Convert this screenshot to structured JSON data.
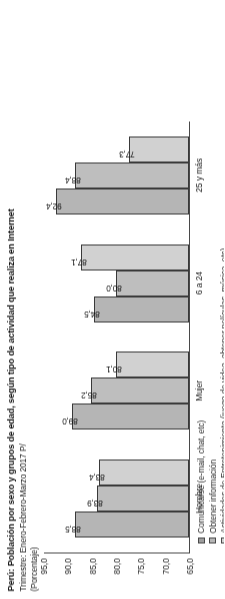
{
  "titles": {
    "main": "Perú: Población por sexo y grupos de edad, según tipo de actividad que realiza en Internet",
    "subtitle": "Trimestre: Enero-Febrero-Marzo 2017 P/",
    "unit": "(Porcentaje)"
  },
  "chart_data": {
    "type": "bar",
    "title": "Perú: Población por sexo y grupos de edad, según tipo de actividad que realiza en Internet",
    "subtitle": "Trimestre: Enero-Febrero-Marzo 2017 P/",
    "xlabel": "",
    "ylabel": "(Porcentaje)",
    "ylim": [
      65.0,
      95.0
    ],
    "yticks": [
      "95,0",
      "90,0",
      "85,0",
      "80,0",
      "75,0",
      "70,0",
      "65,0"
    ],
    "ytick_values": [
      95.0,
      90.0,
      85.0,
      80.0,
      75.0,
      70.0,
      65.0
    ],
    "grid": false,
    "legend_position": "bottom-left",
    "categories": [
      "Hombre",
      "Mujer",
      "6 a 24",
      "25 y más"
    ],
    "series": [
      {
        "name": "Comunicarse (e-mail, chat, etc)",
        "color": "#b4b4b4",
        "values": [
          88.5,
          89.0,
          84.5,
          92.4
        ],
        "labels": [
          "88,5",
          "89,0",
          "84,5",
          "92,4"
        ]
      },
      {
        "name": "Obtener información",
        "color": "#bdbdbd",
        "values": [
          83.9,
          85.2,
          80.0,
          88.4
        ],
        "labels": [
          "83,9",
          "85,2",
          "80,0",
          "88,4"
        ]
      },
      {
        "name": "Actividades de Entretenimiento (juego de video, obtener películas, música, etc)",
        "color": "#cfcfcf",
        "values": [
          83.4,
          80.1,
          87.1,
          77.3
        ],
        "labels": [
          "83,4",
          "80,1",
          "87,1",
          "77,3"
        ]
      }
    ]
  }
}
